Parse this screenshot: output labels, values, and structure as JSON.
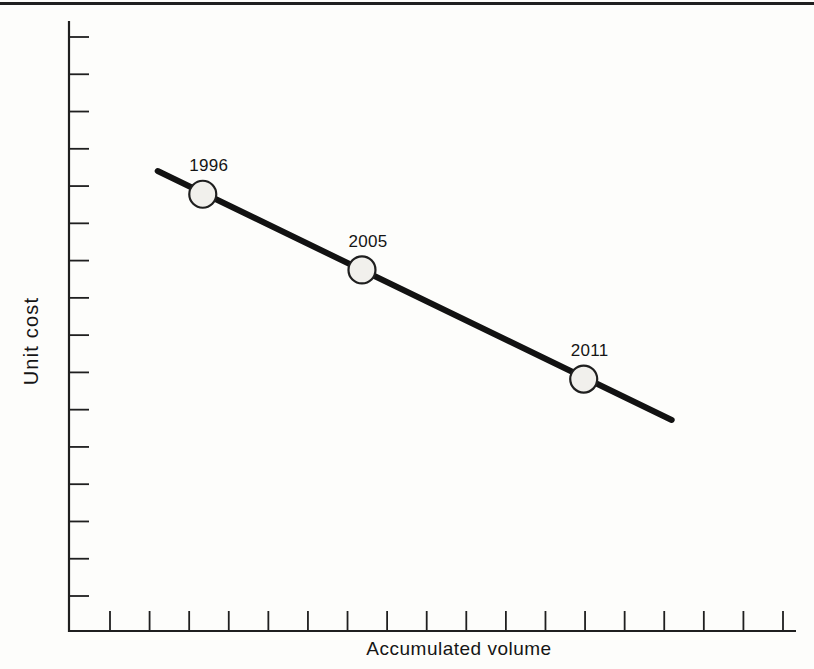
{
  "figure": {
    "header_rule_color": "#2b2b2b"
  },
  "chart_data": {
    "type": "line",
    "title": "",
    "xlabel": "Accumulated volume",
    "ylabel": "Unit cost",
    "grid": false,
    "legend": null,
    "x_axis": {
      "tick_count": 18,
      "tick_values_shown": false
    },
    "y_axis": {
      "tick_count": 16,
      "tick_values_shown": false
    },
    "series": [
      {
        "name": "experience-curve",
        "line_frac": {
          "x1": 0.122,
          "y1": 0.754,
          "x2": 0.829,
          "y2": 0.346
        },
        "points": [
          {
            "label": "1996",
            "x": 0.184,
            "y": 0.716
          },
          {
            "label": "2005",
            "x": 0.403,
            "y": 0.592
          },
          {
            "label": "2011",
            "x": 0.708,
            "y": 0.413
          }
        ]
      }
    ],
    "colors": {
      "trend_line": "#121212",
      "axis": "#1f1f1f",
      "point_fill": "#f1f0ec",
      "point_stroke": "#1f1f1f",
      "text": "#151515"
    }
  }
}
